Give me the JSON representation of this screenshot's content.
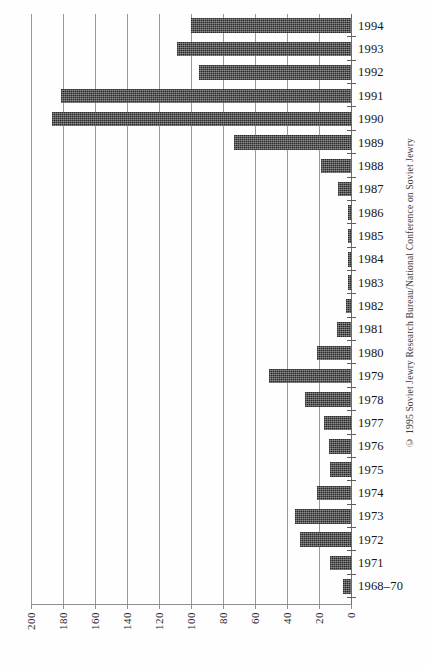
{
  "chart_data": {
    "type": "bar",
    "orientation": "horizontal",
    "title": "",
    "subtitle": "",
    "xlabel": "",
    "ylabel": "",
    "xlim": [
      200,
      0
    ],
    "x_axis_reversed": true,
    "xticks": [
      200,
      180,
      160,
      140,
      120,
      100,
      80,
      60,
      40,
      20,
      0
    ],
    "xtick_labels": [
      "200",
      "180",
      "160",
      "140",
      "120",
      "100",
      "80",
      "60",
      "40",
      "20",
      "0"
    ],
    "grid": true,
    "grid_axis": "x",
    "legend": null,
    "bar_color": "#2b2b2b",
    "bar_fill": "stippled-dark",
    "categories": [
      "1994",
      "1993",
      "1992",
      "1991",
      "1990",
      "1989",
      "1988",
      "1987",
      "1986",
      "1985",
      "1984",
      "1983",
      "1982",
      "1981",
      "1980",
      "1979",
      "1978",
      "1977",
      "1976",
      "1975",
      "1974",
      "1973",
      "1972",
      "1971",
      "1968–70"
    ],
    "values": [
      100,
      109,
      95,
      181,
      187,
      73,
      19,
      8,
      2,
      2,
      2,
      2,
      3,
      9,
      21,
      51,
      29,
      17,
      14,
      13,
      21,
      35,
      32,
      13,
      5
    ],
    "annotations": [
      "© 1995 Soviet Jewry Research Bureau/National Conference on Soviet Jewry"
    ]
  },
  "credit": {
    "text": "© 1995 Soviet Jewry Research Bureau/National Conference on Soviet Jewry"
  }
}
